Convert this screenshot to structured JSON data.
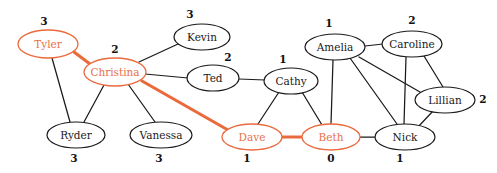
{
  "diagram": {
    "type": "undirected-graph",
    "title": "",
    "colors": {
      "highlight": "#ea6a3c",
      "default_stroke": "#1a1a1a",
      "background": "#ffffff"
    },
    "nodes": [
      {
        "id": "tyler",
        "label": "Tyler",
        "weight": "3",
        "cx": 48,
        "cy": 44,
        "rx": 30,
        "ry": 14,
        "highlight": true,
        "weight_x": 44,
        "weight_y": 22
      },
      {
        "id": "christina",
        "label": "Christina",
        "weight": "2",
        "cx": 115,
        "cy": 72,
        "rx": 31,
        "ry": 14,
        "highlight": true,
        "weight_x": 115,
        "weight_y": 50
      },
      {
        "id": "kevin",
        "label": "Kevin",
        "weight": "3",
        "cx": 202,
        "cy": 37,
        "rx": 28,
        "ry": 13,
        "highlight": false,
        "weight_x": 190,
        "weight_y": 15
      },
      {
        "id": "ted",
        "label": "Ted",
        "weight": "2",
        "cx": 213,
        "cy": 78,
        "rx": 26,
        "ry": 13,
        "highlight": false,
        "weight_x": 228,
        "weight_y": 58
      },
      {
        "id": "cathy",
        "label": "Cathy",
        "weight": "1",
        "cx": 291,
        "cy": 81,
        "rx": 27,
        "ry": 13,
        "highlight": false,
        "weight_x": 283,
        "weight_y": 60
      },
      {
        "id": "amelia",
        "label": "Amelia",
        "weight": "1",
        "cx": 335,
        "cy": 47,
        "rx": 30,
        "ry": 13,
        "highlight": false,
        "weight_x": 329,
        "weight_y": 24
      },
      {
        "id": "caroline",
        "label": "Caroline",
        "weight": "2",
        "cx": 412,
        "cy": 44,
        "rx": 30,
        "ry": 13,
        "highlight": false,
        "weight_x": 412,
        "weight_y": 21
      },
      {
        "id": "lillian",
        "label": "Lillian",
        "weight": "2",
        "cx": 445,
        "cy": 100,
        "rx": 30,
        "ry": 13,
        "highlight": false,
        "weight_x": 483,
        "weight_y": 100
      },
      {
        "id": "nick",
        "label": "Nick",
        "weight": "1",
        "cx": 405,
        "cy": 137,
        "rx": 30,
        "ry": 13,
        "highlight": false,
        "weight_x": 400,
        "weight_y": 159
      },
      {
        "id": "beth",
        "label": "Beth",
        "weight": "0",
        "cx": 331,
        "cy": 137,
        "rx": 29,
        "ry": 13,
        "highlight": true,
        "weight_x": 331,
        "weight_y": 159
      },
      {
        "id": "dave",
        "label": "Dave",
        "weight": "1",
        "cx": 252,
        "cy": 137,
        "rx": 30,
        "ry": 13,
        "highlight": true,
        "weight_x": 247,
        "weight_y": 159
      },
      {
        "id": "vanessa",
        "label": "Vanessa",
        "weight": "3",
        "cx": 161,
        "cy": 135,
        "rx": 31,
        "ry": 13,
        "highlight": false,
        "weight_x": 159,
        "weight_y": 159
      },
      {
        "id": "ryder",
        "label": "Ryder",
        "weight": "3",
        "cx": 76,
        "cy": 135,
        "rx": 29,
        "ry": 13,
        "highlight": false,
        "weight_x": 74,
        "weight_y": 159
      }
    ],
    "edges": [
      {
        "source": "tyler",
        "target": "christina",
        "highlight": true,
        "x1": 74,
        "y1": 52,
        "x2": 90,
        "y2": 64
      },
      {
        "source": "tyler",
        "target": "ryder",
        "highlight": false,
        "x1": 52,
        "y1": 58,
        "x2": 70,
        "y2": 122
      },
      {
        "source": "christina",
        "target": "ryder",
        "highlight": false,
        "x1": 104,
        "y1": 85,
        "x2": 84,
        "y2": 122
      },
      {
        "source": "christina",
        "target": "vanessa",
        "highlight": false,
        "x1": 128,
        "y1": 84,
        "x2": 155,
        "y2": 122
      },
      {
        "source": "christina",
        "target": "kevin",
        "highlight": false,
        "x1": 139,
        "y1": 62,
        "x2": 178,
        "y2": 44
      },
      {
        "source": "christina",
        "target": "ted",
        "highlight": false,
        "x1": 145,
        "y1": 74,
        "x2": 188,
        "y2": 78
      },
      {
        "source": "christina",
        "target": "dave",
        "highlight": true,
        "x1": 142,
        "y1": 81,
        "x2": 228,
        "y2": 130
      },
      {
        "source": "ted",
        "target": "cathy",
        "highlight": false,
        "x1": 239,
        "y1": 79,
        "x2": 265,
        "y2": 80
      },
      {
        "source": "cathy",
        "target": "dave",
        "highlight": false,
        "x1": 279,
        "y1": 92,
        "x2": 258,
        "y2": 124
      },
      {
        "source": "cathy",
        "target": "beth",
        "highlight": false,
        "x1": 302,
        "y1": 92,
        "x2": 322,
        "y2": 125
      },
      {
        "source": "dave",
        "target": "beth",
        "highlight": true,
        "x1": 281,
        "y1": 137,
        "x2": 303,
        "y2": 137
      },
      {
        "source": "amelia",
        "target": "beth",
        "highlight": false,
        "x1": 333,
        "y1": 60,
        "x2": 331,
        "y2": 124
      },
      {
        "source": "amelia",
        "target": "caroline",
        "highlight": false,
        "x1": 365,
        "y1": 46,
        "x2": 383,
        "y2": 44
      },
      {
        "source": "amelia",
        "target": "nick",
        "highlight": false,
        "x1": 350,
        "y1": 58,
        "x2": 397,
        "y2": 124
      },
      {
        "source": "amelia",
        "target": "lillian",
        "highlight": false,
        "x1": 359,
        "y1": 57,
        "x2": 420,
        "y2": 92
      },
      {
        "source": "caroline",
        "target": "nick",
        "highlight": false,
        "x1": 406,
        "y1": 57,
        "x2": 404,
        "y2": 124
      },
      {
        "source": "caroline",
        "target": "lillian",
        "highlight": false,
        "x1": 424,
        "y1": 56,
        "x2": 443,
        "y2": 87
      },
      {
        "source": "lillian",
        "target": "nick",
        "highlight": false,
        "x1": 433,
        "y1": 111,
        "x2": 418,
        "y2": 127
      },
      {
        "source": "beth",
        "target": "nick",
        "highlight": false,
        "x1": 360,
        "y1": 137,
        "x2": 375,
        "y2": 137
      }
    ]
  }
}
